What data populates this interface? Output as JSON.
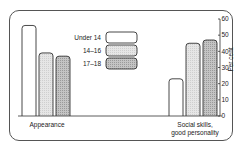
{
  "chart_data": {
    "type": "bar",
    "title": "",
    "categories": [
      "Appearance",
      "Social skills, good personality"
    ],
    "category_lines": [
      [
        "Appearance"
      ],
      [
        "Social skills,",
        "good personality"
      ]
    ],
    "series": [
      {
        "name": "Under 14",
        "values": [
          56,
          23
        ],
        "fill": "#ffffff"
      },
      {
        "name": "14–16",
        "values": [
          39,
          45
        ],
        "fill": "#e2e2e2"
      },
      {
        "name": "17–18",
        "values": [
          37,
          47
        ],
        "fill": "#bdbdbd"
      }
    ],
    "xlabel": "",
    "ylabel": "Per cent",
    "ylim": [
      0,
      60
    ],
    "yticks": [
      0,
      10,
      20,
      30,
      40,
      50,
      60
    ],
    "y_axis_position": "right",
    "legend_position": "center",
    "grid": false
  }
}
